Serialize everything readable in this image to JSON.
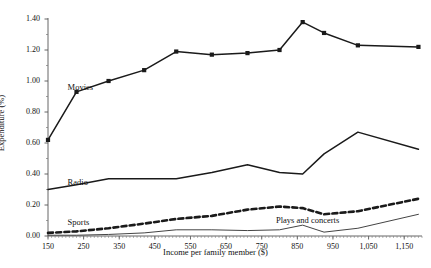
{
  "chart_data": {
    "type": "line",
    "title": "",
    "xlabel": "Income per family member ($)",
    "ylabel": "Expenditure (%)",
    "xlim": [
      150,
      1200
    ],
    "ylim": [
      0.0,
      1.4
    ],
    "xticks": [
      150,
      250,
      350,
      450,
      550,
      650,
      750,
      850,
      950,
      1050,
      1150
    ],
    "xtick_labels": [
      "150",
      "250",
      "350",
      "450",
      "550",
      "650",
      "750",
      "850",
      "950",
      "1,050",
      "1,150"
    ],
    "yticks": [
      0.0,
      0.2,
      0.4,
      0.6,
      0.8,
      1.0,
      1.2,
      1.4
    ],
    "ytick_labels": [
      "0.00",
      "0.20",
      "0.40",
      "0.60",
      "0.80",
      "1.00",
      "1.20",
      "1.40"
    ],
    "grid": false,
    "legend": "inline-labels",
    "x": [
      150,
      230,
      320,
      420,
      510,
      610,
      710,
      800,
      865,
      925,
      1020,
      1190
    ],
    "series": [
      {
        "name": "Movies",
        "label": "Movies",
        "style": "solid-markers",
        "color": "#1a1a1a",
        "values": [
          0.62,
          0.93,
          1.0,
          1.07,
          1.19,
          1.17,
          1.18,
          1.2,
          1.38,
          1.31,
          1.23,
          1.22
        ]
      },
      {
        "name": "Radio",
        "label": "Radio",
        "style": "solid",
        "color": "#1a1a1a",
        "values": [
          0.3,
          0.33,
          0.37,
          0.37,
          0.37,
          0.41,
          0.46,
          0.41,
          0.4,
          0.53,
          0.67,
          0.56
        ]
      },
      {
        "name": "Sports",
        "label": "Sports",
        "style": "dashed",
        "color": "#1a1a1a",
        "values": [
          0.02,
          0.03,
          0.05,
          0.08,
          0.11,
          0.13,
          0.17,
          0.19,
          0.18,
          0.14,
          0.16,
          0.24
        ]
      },
      {
        "name": "Plays and concerts",
        "label": "Plays and concerts",
        "style": "thin-solid",
        "color": "#444444",
        "values": [
          0.005,
          0.005,
          0.01,
          0.02,
          0.04,
          0.04,
          0.035,
          0.04,
          0.07,
          0.025,
          0.05,
          0.14
        ]
      }
    ],
    "annotations": [
      {
        "text": "Movies",
        "x": 205,
        "y": 0.955
      },
      {
        "text": "Radio",
        "x": 205,
        "y": 0.345
      },
      {
        "text": "Sports",
        "x": 205,
        "y": 0.085
      },
      {
        "text": "Plays and concerts",
        "x": 790,
        "y": 0.095
      }
    ]
  }
}
